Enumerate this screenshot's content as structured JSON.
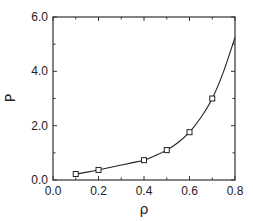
{
  "chart_data": {
    "type": "line",
    "title": "",
    "xlabel": "ρ",
    "ylabel": "P",
    "xlim": [
      0.0,
      0.8
    ],
    "ylim": [
      0.0,
      6.0
    ],
    "xticks": [
      0.0,
      0.2,
      0.4,
      0.6,
      0.8
    ],
    "xtick_labels": [
      "0.0",
      "0.2",
      "0.4",
      "0.6",
      "0.8"
    ],
    "xminor": [
      0.1,
      0.3,
      0.5,
      0.7
    ],
    "yticks": [
      0.0,
      2.0,
      4.0,
      6.0
    ],
    "ytick_labels": [
      "0.0",
      "2.0",
      "4.0",
      "6.0"
    ],
    "yminor": [
      1.0,
      3.0,
      5.0
    ],
    "grid": false,
    "legend": null,
    "series": [
      {
        "name": "markers",
        "style": "open-square",
        "x": [
          0.1,
          0.2,
          0.4,
          0.5,
          0.6,
          0.7
        ],
        "y": [
          0.22,
          0.37,
          0.73,
          1.1,
          1.76,
          3.0
        ]
      },
      {
        "name": "fit-curve",
        "style": "solid-line",
        "x": [
          0.1,
          0.15,
          0.2,
          0.25,
          0.3,
          0.35,
          0.4,
          0.45,
          0.5,
          0.55,
          0.6,
          0.65,
          0.7,
          0.75,
          0.8
        ],
        "y": [
          0.22,
          0.29,
          0.37,
          0.46,
          0.55,
          0.64,
          0.73,
          0.9,
          1.1,
          1.38,
          1.76,
          2.3,
          3.0,
          4.0,
          5.25
        ]
      }
    ]
  },
  "labels": {
    "x_axis": "ρ",
    "y_axis": "P"
  },
  "colors": {
    "axis": "#333333",
    "line": "#222222",
    "marker_fill": "#ffffff"
  }
}
